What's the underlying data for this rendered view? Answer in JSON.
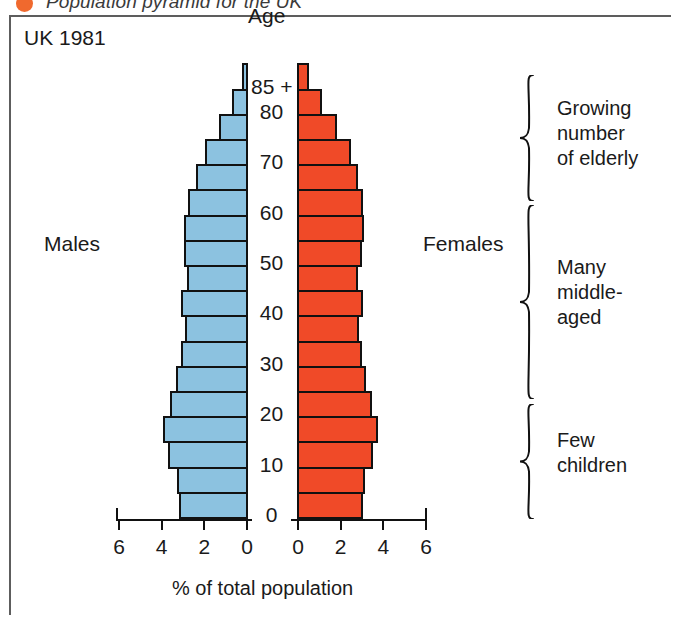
{
  "caption": {
    "bullet_color": "#f0692e",
    "text": "Population pyramid for the UK"
  },
  "figure": {
    "corner_label": "UK 1981",
    "age_axis_title": "Age",
    "male_label": "Males",
    "female_label": "Females",
    "xaxis_title": "% of total population"
  },
  "colors": {
    "male_fill": "#8cc2e0",
    "female_fill": "#f04a28",
    "bar_outline": "#111111",
    "frame": "#5d5d5d"
  },
  "annotations": [
    {
      "id": "growing-elderly",
      "label": "Growing\nnumber\nof elderly"
    },
    {
      "id": "many-middle-aged",
      "label": "Many\nmiddle-\naged"
    },
    {
      "id": "few-children",
      "label": "Few\nchildren"
    }
  ],
  "chart_data": {
    "type": "bar",
    "subtype": "population-pyramid",
    "title": "Population pyramid for the UK",
    "annotation_in_plot": "UK 1981",
    "xlabel": "% of total population",
    "ylabel": "Age",
    "xlim": [
      0,
      6
    ],
    "x_ticks_left": [
      "6",
      "4",
      "2",
      "0"
    ],
    "x_ticks_right": [
      "0",
      "2",
      "4",
      "6"
    ],
    "y_ticks": [
      "0",
      "10",
      "20",
      "30",
      "40",
      "50",
      "60",
      "70",
      "80",
      "85 +"
    ],
    "grid": false,
    "legend": [
      "Males",
      "Females"
    ],
    "legend_position": "in-plot-sides",
    "categories": [
      "0-4",
      "5-9",
      "10-14",
      "15-19",
      "20-24",
      "25-29",
      "30-34",
      "35-39",
      "40-44",
      "45-49",
      "50-54",
      "55-59",
      "60-64",
      "65-69",
      "70-74",
      "75-79",
      "80-84",
      "85+"
    ],
    "series": [
      {
        "name": "Males",
        "units": "% of total population",
        "values": [
          3.15,
          3.25,
          3.65,
          3.9,
          3.55,
          3.3,
          3.05,
          2.85,
          3.05,
          2.75,
          2.9,
          2.9,
          2.7,
          2.35,
          1.9,
          1.25,
          0.65,
          0.18
        ]
      },
      {
        "name": "Females",
        "units": "% of total population",
        "values": [
          3.0,
          3.1,
          3.45,
          3.7,
          3.4,
          3.15,
          2.95,
          2.8,
          3.0,
          2.75,
          2.95,
          3.05,
          3.0,
          2.75,
          2.45,
          1.8,
          1.1,
          0.48
        ]
      }
    ]
  }
}
